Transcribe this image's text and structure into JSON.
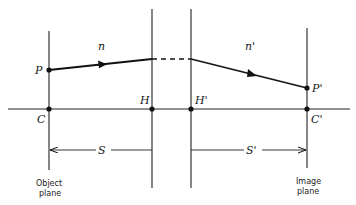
{
  "diagram": {
    "points": {
      "P": "P",
      "P_prime": "P'",
      "C": "C",
      "C_prime": "C'",
      "H": "H",
      "H_prime": "H'"
    },
    "media": {
      "object_side_index": "n",
      "image_side_index": "n'"
    },
    "distances": {
      "object_distance": "S",
      "image_distance": "S'"
    },
    "captions": {
      "object_plane_line1": "Object",
      "object_plane_line2": "plane",
      "image_plane_line1": "Image",
      "image_plane_line2": "plane"
    }
  }
}
